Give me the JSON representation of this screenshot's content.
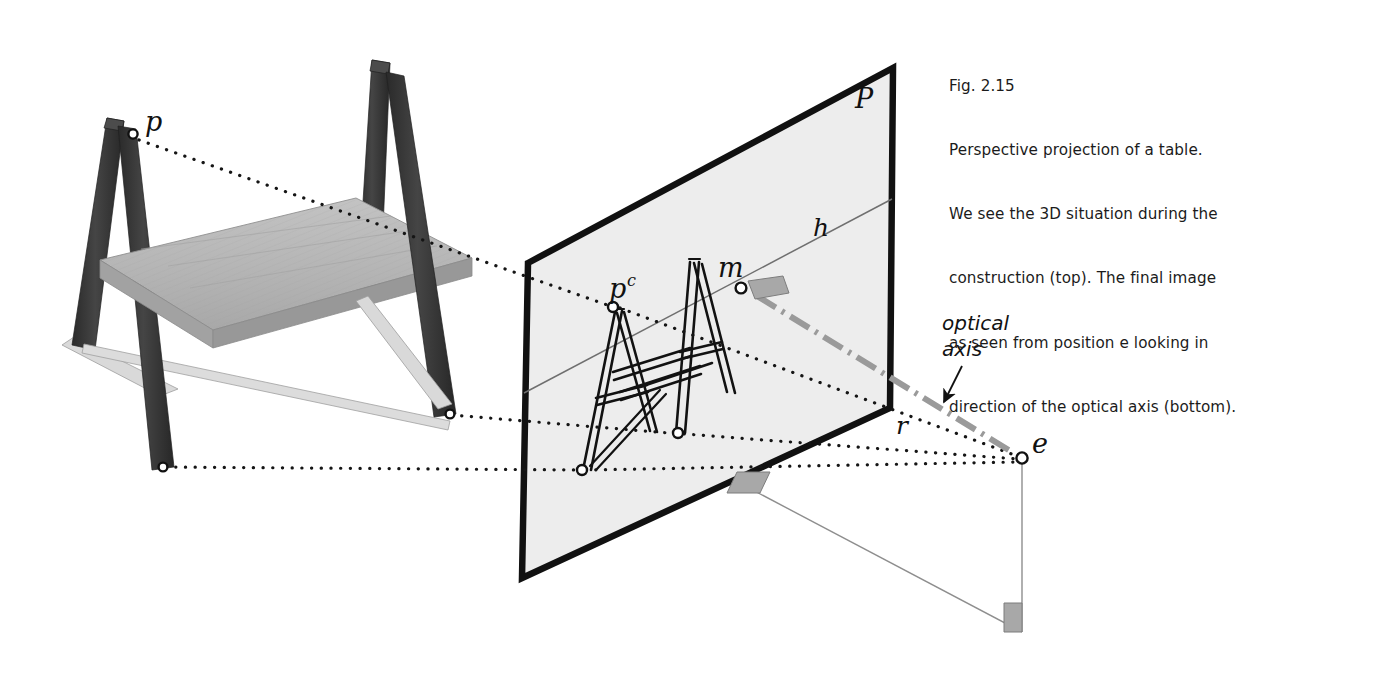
{
  "figure": {
    "number": "Fig. 2.15",
    "caption_lines": [
      "Fig. 2.15",
      "Perspective projection of a table.",
      "We see the 3D situation during the",
      "construction (top). The final image",
      "as seen from position e looking in",
      "direction of the optical axis (bottom)."
    ],
    "caption_text": "Fig. 2.15 Perspective projection of a table. We see the 3D situation during the construction (top). The final image as seen from position e looking in direction of the optical axis (bottom)."
  },
  "labels": {
    "plane": "P",
    "horizon": "h",
    "object_point": "p",
    "projected_point": "p",
    "projected_point_sup": "c",
    "principal_point": "m",
    "radius": "r",
    "eye": "e",
    "optical_axis_line1": "optical",
    "optical_axis_line2": "axis"
  },
  "colors": {
    "background": "#ffffff",
    "plane_fill": "#ededed",
    "plane_border": "#111111",
    "text": "#1b1b1b",
    "leg_dark": "#3a3a3a",
    "leg_darker": "#2b2b2b",
    "tabletop": "#b4b4b4",
    "tabletop_edge": "#9a9a9a",
    "brace_light": "#d8d8d8",
    "ray_dotted": "#151515",
    "optical_axis": "#9a9a9a",
    "thin_line": "#8e8e8e",
    "right_angle_marker": "#a8a8a8",
    "marker_fill": "#ffffff",
    "marker_stroke": "#111111"
  },
  "geometry": {
    "plane_corners": [
      [
        528,
        263
      ],
      [
        893,
        68
      ],
      [
        890,
        408
      ],
      [
        522,
        578
      ]
    ],
    "horizon_line": [
      [
        524,
        393
      ],
      [
        892,
        199
      ]
    ],
    "eye_point": [
      1022,
      458
    ],
    "principal_point_m": [
      741,
      288
    ],
    "projected_p_point": [
      613,
      307
    ],
    "object_p_point": [
      133,
      134
    ],
    "ground_drop_end": [
      1022,
      632
    ]
  }
}
